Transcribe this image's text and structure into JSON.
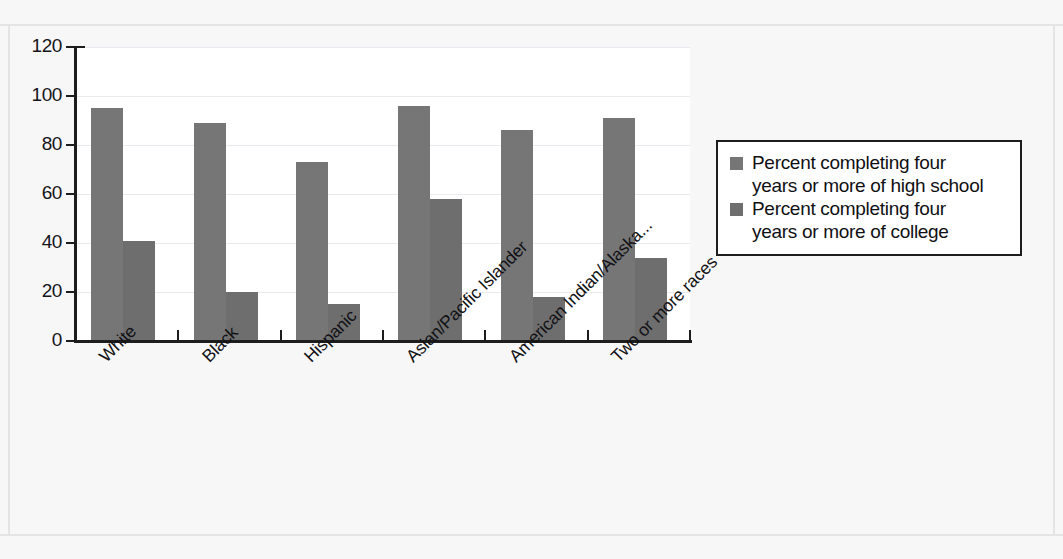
{
  "chart_data": {
    "type": "bar",
    "title": "",
    "subtitle": "",
    "xlabel": "",
    "ylabel": "",
    "ylim": [
      0,
      120
    ],
    "ytick_step": 20,
    "yticks": [
      0,
      20,
      40,
      60,
      80,
      100,
      120
    ],
    "grid": true,
    "grid_axis": "y",
    "legend_position": "right",
    "categories": [
      "White",
      "Black",
      "Hispanic",
      "Asian/Pacific Islander",
      "American Indian/Alaska...",
      "Two or more races"
    ],
    "series": [
      {
        "name": "Percent completing four years or more of high school",
        "color": "#767676",
        "values": [
          95,
          89,
          73,
          96,
          86,
          91
        ]
      },
      {
        "name": "Percent completing four years or more of college",
        "color": "#6e6e6e",
        "values": [
          41,
          20,
          15,
          58,
          18,
          34
        ]
      }
    ]
  },
  "legend": {
    "entries": [
      {
        "swatch": "series-1-swatch",
        "line1": "Percent completing four",
        "line2": "years or more of high school"
      },
      {
        "swatch": "series-2-swatch",
        "line1": "Percent completing four",
        "line2": "years or more of college"
      }
    ]
  },
  "axes": {
    "ytick_labels": [
      "120",
      "100",
      "80",
      "60",
      "40",
      "20",
      "0"
    ]
  },
  "colors": {
    "series_1": "#767676",
    "series_2": "#6e6e6e",
    "axis": "#1d1d1d",
    "gridline": "#e9e9ef",
    "figure_background": "#f7f7f7",
    "plot_background": "#ffffff"
  }
}
